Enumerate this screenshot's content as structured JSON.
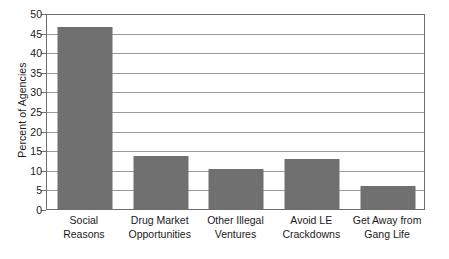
{
  "chart_data": {
    "type": "bar",
    "title": "",
    "xlabel": "",
    "ylabel": "Percent of Agencies",
    "ylim": [
      0,
      50
    ],
    "ytick_step": 5,
    "grid": true,
    "legend": "none",
    "categories": [
      "Social Reasons",
      "Drug Market Opportunities",
      "Other Illegal Ventures",
      "Avoid LE Crackdowns",
      "Get Away from Gang Life"
    ],
    "category_lines": [
      [
        "Social",
        "Reasons"
      ],
      [
        "Drug Market",
        "Opportunities"
      ],
      [
        "Other Illegal",
        "Ventures"
      ],
      [
        "Avoid LE",
        "Crackdowns"
      ],
      [
        "Get Away from",
        "Gang Life"
      ]
    ],
    "values": [
      46.5,
      13.6,
      10.2,
      12.8,
      5.8
    ],
    "yticks": [
      0,
      5,
      10,
      15,
      20,
      25,
      30,
      35,
      40,
      45,
      50
    ],
    "ytick_labels": [
      "0",
      "5",
      "10",
      "15",
      "20",
      "25",
      "30",
      "35",
      "40",
      "45",
      "50"
    ]
  },
  "colors": {
    "bar": "#707070",
    "gridline": "#9a9a9a",
    "axis": "#6e6e6e",
    "text": "#1a1a1a",
    "background": "#ffffff"
  }
}
